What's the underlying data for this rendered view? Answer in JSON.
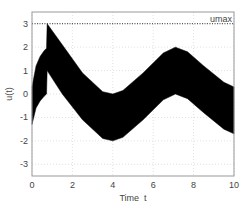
{
  "chart_data": {
    "type": "area",
    "title": "",
    "xlabel": "Time  t",
    "ylabel": "u(t)",
    "xlim": [
      0,
      10
    ],
    "ylim": [
      -3.5,
      3.5
    ],
    "xticks": [
      0,
      2,
      4,
      6,
      8,
      10
    ],
    "yticks": [
      -3,
      -2,
      -1,
      0,
      1,
      2,
      3
    ],
    "grid": true,
    "annotations": [
      {
        "text": "umax",
        "x": 10,
        "y": 3,
        "style": "dotted horizontal line at y=3"
      }
    ],
    "band_color": "#000000",
    "series": [
      {
        "name": "upper bound",
        "x": [
          0,
          0.2,
          0.4,
          0.6,
          0.72,
          0.75,
          1.5,
          2.5,
          3.5,
          4.0,
          4.5,
          5.5,
          6.5,
          7.1,
          7.7,
          8.5,
          9.5,
          10
        ],
        "values": [
          0.3,
          1.2,
          1.6,
          1.85,
          1.95,
          3.0,
          2.1,
          0.9,
          0.1,
          0.0,
          0.15,
          0.9,
          1.75,
          2.0,
          1.8,
          1.2,
          0.5,
          0.3
        ]
      },
      {
        "name": "lower bound",
        "x": [
          0,
          0.2,
          0.4,
          0.6,
          0.72,
          0.75,
          1.5,
          2.5,
          3.5,
          4.0,
          4.5,
          5.5,
          6.5,
          7.1,
          7.7,
          8.5,
          9.5,
          10
        ],
        "values": [
          -1.3,
          -0.6,
          -0.3,
          -0.1,
          0.0,
          1.0,
          0.0,
          -1.1,
          -1.9,
          -2.0,
          -1.85,
          -1.1,
          -0.25,
          0.0,
          -0.2,
          -0.8,
          -1.5,
          -1.7
        ]
      }
    ]
  },
  "labels": {
    "xlabel": "Time  t",
    "ylabel": "u(t)",
    "umax": "umax",
    "xticks": [
      "0",
      "2",
      "4",
      "6",
      "8",
      "10"
    ],
    "yticks": [
      "3",
      "2",
      "1",
      "0",
      "-1",
      "-2",
      "-3"
    ]
  }
}
